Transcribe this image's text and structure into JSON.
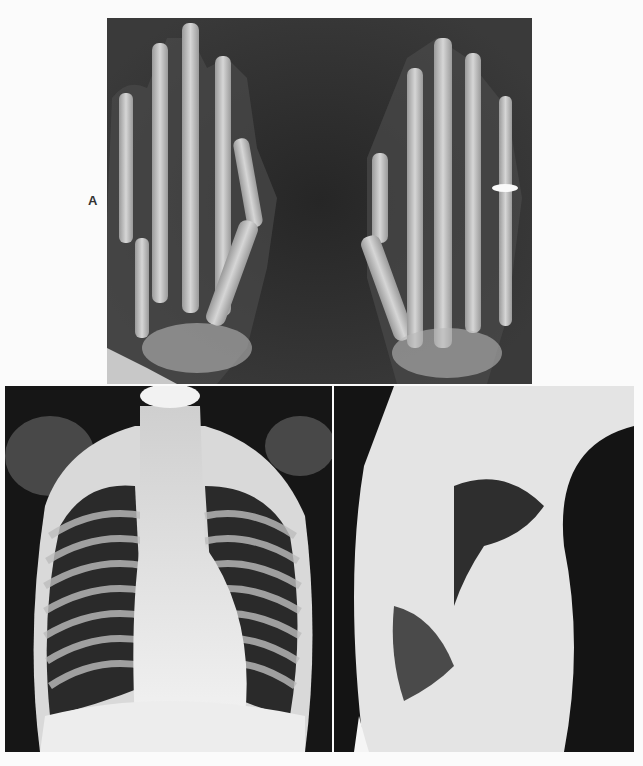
{
  "figure": {
    "panel_label": "A",
    "panels": [
      {
        "id": "hands",
        "description": "PA radiograph of both hands"
      },
      {
        "id": "chest-pa",
        "description": "Frontal chest radiograph"
      },
      {
        "id": "chest-lateral",
        "description": "Lateral chest radiograph"
      }
    ]
  },
  "colors": {
    "page_background": "#fbfbfb",
    "film_dark": "#1c1c1c",
    "bone": "#d8d8d8"
  }
}
